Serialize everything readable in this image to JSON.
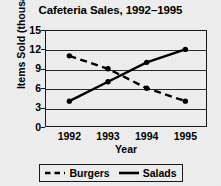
{
  "chart_data": {
    "type": "line",
    "title": "Cafeteria Sales, 1992–1995",
    "xlabel": "Year",
    "ylabel": "Items Sold (thousands)",
    "categories": [
      "1992",
      "1993",
      "1994",
      "1995"
    ],
    "x": [
      1992,
      1993,
      1994,
      1995
    ],
    "xtick_labels": [
      "1992",
      "1993",
      "1994",
      "1995"
    ],
    "ytick_labels": [
      "0",
      "3",
      "6",
      "9",
      "12",
      "15"
    ],
    "yticks": [
      0,
      3,
      6,
      9,
      12,
      15
    ],
    "ylim": [
      0,
      15
    ],
    "grid": "horizontal",
    "legend_position": "below-axes",
    "series": [
      {
        "name": "Burgers",
        "values": [
          11,
          9,
          6,
          4
        ],
        "linestyle": "dashed",
        "marker": "circle",
        "color": "#000000"
      },
      {
        "name": "Salads",
        "values": [
          4,
          7,
          10,
          12
        ],
        "linestyle": "solid",
        "marker": "circle",
        "color": "#000000"
      }
    ]
  },
  "legend": {
    "entries": [
      {
        "label": "Burgers",
        "style": "dashed"
      },
      {
        "label": "Salads",
        "style": "solid"
      }
    ]
  },
  "colors": {
    "background": "#eeeeee",
    "ink": "#000000",
    "axis": "#1a1a1a",
    "gridline": "#2b2b2b"
  }
}
